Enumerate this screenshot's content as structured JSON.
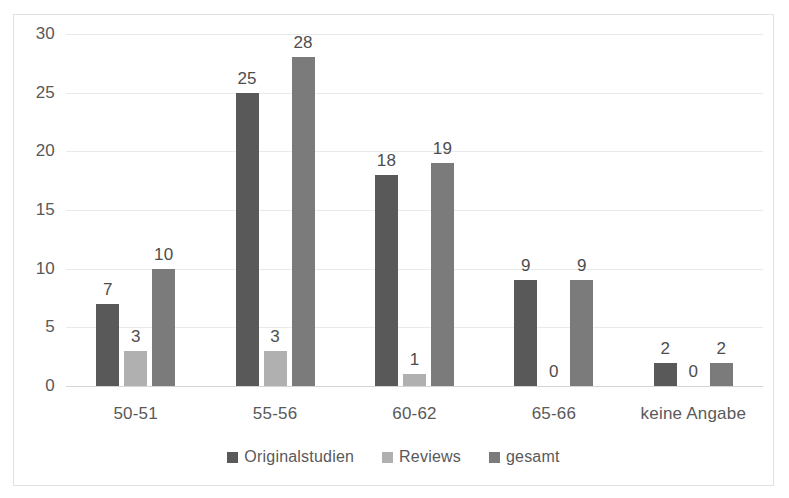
{
  "chart_data": {
    "type": "bar",
    "title": "",
    "subtitle": "",
    "xlabel": "",
    "ylabel": "",
    "categories": [
      "50-51",
      "55-56",
      "60-62",
      "65-66",
      "keine Angabe"
    ],
    "series": [
      {
        "name": "Originalstudien",
        "color": "#595959",
        "values": [
          7,
          25,
          18,
          9,
          2
        ]
      },
      {
        "name": "Reviews",
        "color": "#b0b0b0",
        "values": [
          3,
          3,
          1,
          0,
          0
        ]
      },
      {
        "name": "gesamt",
        "color": "#7b7b7b",
        "values": [
          10,
          28,
          19,
          9,
          2
        ]
      }
    ],
    "ylim": [
      0,
      30
    ],
    "yticks": [
      0,
      5,
      10,
      15,
      20,
      25,
      30
    ],
    "ytick_labels": [
      "0",
      "5",
      "10",
      "15",
      "20",
      "25",
      "30"
    ],
    "data_labels": true,
    "grid": "horizontal",
    "legend_position": "bottom",
    "plot_border": true
  },
  "colors": {
    "series_dark": "#595959",
    "series_light": "#b0b0b0",
    "series_medium": "#7b7b7b",
    "gridline": "#e8eaec",
    "axis": "#d2d4d6",
    "text": "#595959",
    "border": "#e2e2e2",
    "background": "#ffffff"
  }
}
